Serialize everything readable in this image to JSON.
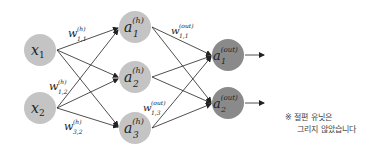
{
  "diagram": {
    "colors": {
      "input_node": "#c4c4c4",
      "hidden_node": "#c4c4c4",
      "output_node": "#8a8a8a",
      "edge": "#222222",
      "background": "#ffffff"
    },
    "nodes": {
      "input": [
        {
          "id": "x1",
          "base": "x",
          "sub": "1",
          "sup": ""
        },
        {
          "id": "x2",
          "base": "x",
          "sub": "2",
          "sup": ""
        }
      ],
      "hidden": [
        {
          "id": "a1h",
          "base": "a",
          "sub": "1",
          "sup": "(h)"
        },
        {
          "id": "a2h",
          "base": "a",
          "sub": "2",
          "sup": "(h)"
        },
        {
          "id": "a3h",
          "base": "a",
          "sub": "3",
          "sup": "(h)"
        }
      ],
      "output": [
        {
          "id": "a1out",
          "base": "a",
          "sub": "1",
          "sup": "(out)"
        },
        {
          "id": "a2out",
          "base": "a",
          "sub": "2",
          "sup": "(out)"
        }
      ]
    },
    "weight_labels": [
      {
        "base": "w",
        "sub": "1,1",
        "sup": "(h)"
      },
      {
        "base": "w",
        "sub": "1,2",
        "sup": "(h)"
      },
      {
        "base": "w",
        "sub": "3,2",
        "sup": "(h)"
      },
      {
        "base": "w",
        "sub": "1,1",
        "sup": "(out)"
      },
      {
        "base": "w",
        "sub": "1,3",
        "sup": "(out)"
      }
    ]
  },
  "note": {
    "line1": "※ 절편 유닛은",
    "line2": "그리지 않았습니다"
  }
}
